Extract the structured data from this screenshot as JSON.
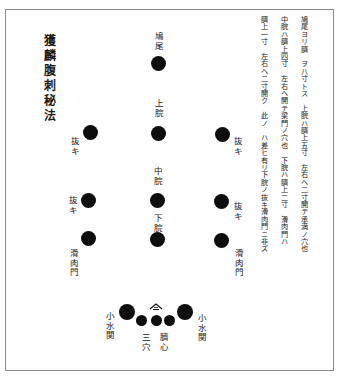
{
  "document": {
    "title": "獲麟腹刺秘法",
    "notes": [
      "鳩尾ヨリ臍　ヲ八寸トス　上脘ハ臍上五寸　左右ヘ二寸開テ承満ノ穴也",
      "中脘ハ臍上四寸　左右ヘ開テ梁門ノ穴也　下脘ハ臍上二寸　滑肉門ハ",
      "臍上一寸　左右ヘ二寸開ク　此ノ　ハ差ヒ有リ下脘ノ抜キ滑肉門ニ非ズ"
    ],
    "points": {
      "kyubi": "鳩尾",
      "jokan": "上脘",
      "chukan": "中脘",
      "gekan": "下脘",
      "nuki_upper_left": "抜キ",
      "nuki_upper_right": "抜キ",
      "nuki_lower_left": "抜キ",
      "nuki_lower_right": "抜キ",
      "katsunikumon_left": "滑肉門",
      "katsunikumon_right": "滑肉門",
      "shosuikan_left": "小水関",
      "shosuikan_right": "小水関",
      "sanketsu": "三穴",
      "saishin": "臍心"
    }
  }
}
